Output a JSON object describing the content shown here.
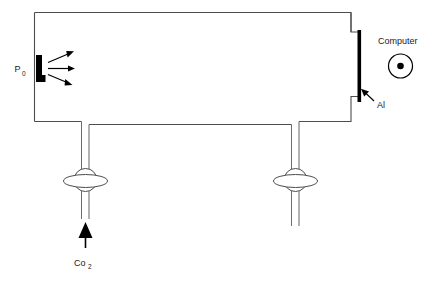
{
  "diagram": {
    "labels": {
      "source": "P",
      "source_subscript": "0",
      "computer": "Computer",
      "electrode": "Al",
      "gas": "Co",
      "gas_subscript": "2"
    },
    "colors": {
      "wall_stroke": "#4d4d4d",
      "tube_stroke": "#6b6b6b",
      "solid_black": "#000000",
      "background": "#ffffff",
      "text": "#1a1a1a"
    },
    "components": [
      {
        "name": "chamber",
        "kind": "rectangular-vessel"
      },
      {
        "name": "source-emitter",
        "kind": "filled-bar"
      },
      {
        "name": "emission-rays",
        "kind": "arrow-triplet",
        "count": 3
      },
      {
        "name": "aluminium-electrode",
        "kind": "filled-bar"
      },
      {
        "name": "computer-terminal",
        "kind": "circle-with-dot"
      },
      {
        "name": "left-valve",
        "kind": "valve"
      },
      {
        "name": "right-valve",
        "kind": "valve"
      },
      {
        "name": "left-tube",
        "kind": "pipe"
      },
      {
        "name": "right-tube",
        "kind": "pipe"
      },
      {
        "name": "gas-inlet-arrow",
        "kind": "filled-arrow"
      }
    ]
  }
}
